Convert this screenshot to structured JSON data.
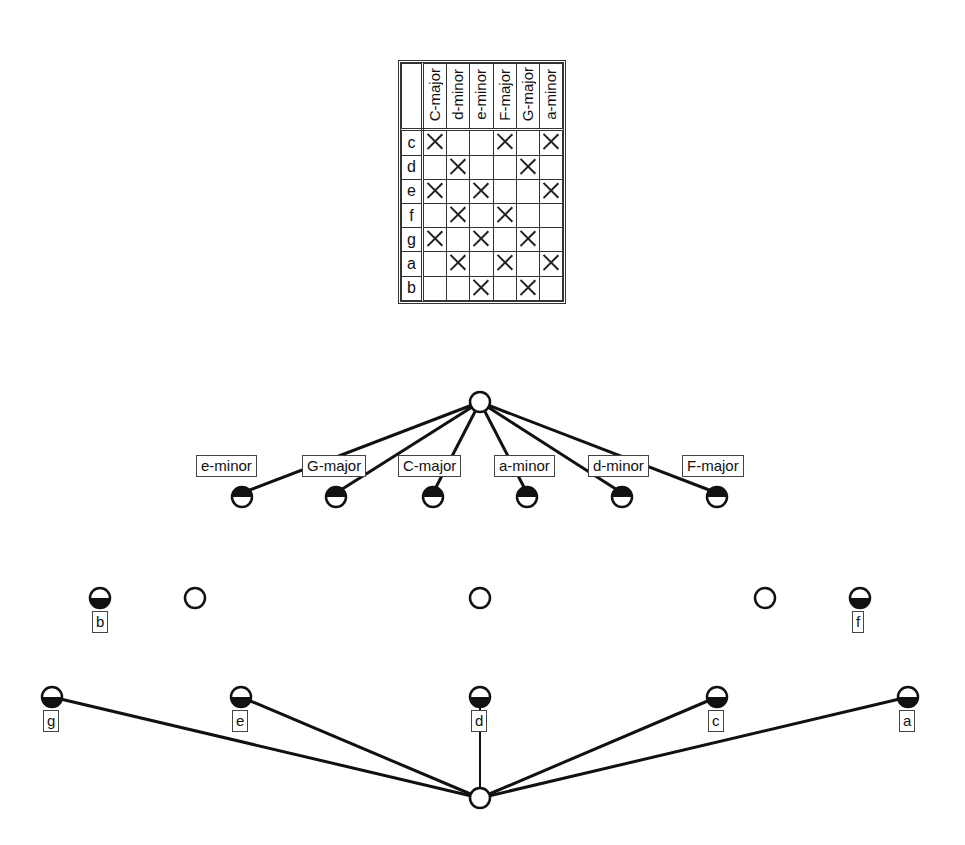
{
  "context_table": {
    "attributes": [
      "C-major",
      "d-minor",
      "e-minor",
      "F-major",
      "G-major",
      "a-minor"
    ],
    "objects": [
      {
        "name": "c",
        "marks": [
          true,
          false,
          false,
          true,
          false,
          true
        ]
      },
      {
        "name": "d",
        "marks": [
          false,
          true,
          false,
          false,
          true,
          false
        ]
      },
      {
        "name": "e",
        "marks": [
          true,
          false,
          true,
          false,
          false,
          true
        ]
      },
      {
        "name": "f",
        "marks": [
          false,
          true,
          false,
          true,
          false,
          false
        ]
      },
      {
        "name": "g",
        "marks": [
          true,
          false,
          true,
          false,
          true,
          false
        ]
      },
      {
        "name": "a",
        "marks": [
          false,
          true,
          false,
          true,
          false,
          true
        ]
      },
      {
        "name": "b",
        "marks": [
          false,
          false,
          true,
          false,
          true,
          false
        ]
      }
    ]
  },
  "lattice": {
    "top_node": {
      "x": 480,
      "y": 402
    },
    "attribute_nodes": [
      {
        "label": "e-minor",
        "x": 242,
        "y": 497,
        "label_x": 196,
        "label_y": 455,
        "label_w": 74
      },
      {
        "label": "G-major",
        "x": 336,
        "y": 497,
        "label_x": 302,
        "label_y": 455,
        "label_w": 72
      },
      {
        "label": "C-major",
        "x": 433,
        "y": 497,
        "label_x": 398,
        "label_y": 455,
        "label_w": 72
      },
      {
        "label": "a-minor",
        "x": 527,
        "y": 497,
        "label_x": 494,
        "label_y": 455,
        "label_w": 70
      },
      {
        "label": "d-minor",
        "x": 622,
        "y": 497,
        "label_x": 588,
        "label_y": 455,
        "label_w": 72
      },
      {
        "label": "F-major",
        "x": 717,
        "y": 497,
        "label_x": 682,
        "label_y": 455,
        "label_w": 72
      }
    ],
    "middle_nodes": [
      {
        "type": "half",
        "label": "b",
        "x": 100,
        "y": 598
      },
      {
        "type": "empty",
        "x": 195,
        "y": 598
      },
      {
        "type": "empty",
        "x": 480,
        "y": 598
      },
      {
        "type": "empty",
        "x": 765,
        "y": 598
      },
      {
        "type": "half",
        "label": "f",
        "x": 860,
        "y": 598
      }
    ],
    "object_nodes": [
      {
        "label": "g",
        "x": 52,
        "y": 697
      },
      {
        "label": "e",
        "x": 241,
        "y": 697
      },
      {
        "label": "d",
        "x": 480,
        "y": 697
      },
      {
        "label": "c",
        "x": 717,
        "y": 697
      },
      {
        "label": "a",
        "x": 908,
        "y": 697
      }
    ],
    "bottom_node": {
      "x": 480,
      "y": 798
    }
  }
}
